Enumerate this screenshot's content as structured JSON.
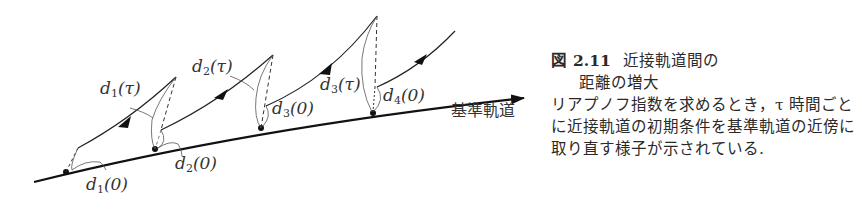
{
  "figure": {
    "number_prefix": "図",
    "number": "2.11",
    "title_line1": "近接軌道間の",
    "title_line2": "距離の増大",
    "description": "リアプノフ指数を求めるとき，τ 時間ごとに近接軌道の初期条件を基準軌道の近傍に取り直す様子が示されている."
  },
  "diagram": {
    "reference_trajectory_label": "基準軌道",
    "labels": {
      "d1_tau": {
        "var": "d",
        "sub": "1",
        "arg": "(τ)"
      },
      "d2_tau": {
        "var": "d",
        "sub": "2",
        "arg": "(τ)"
      },
      "d3_tau": {
        "var": "d",
        "sub": "3",
        "arg": "(τ)"
      },
      "d1_0": {
        "var": "d",
        "sub": "1",
        "arg": "(0)"
      },
      "d2_0": {
        "var": "d",
        "sub": "2",
        "arg": "(0)"
      },
      "d3_0": {
        "var": "d",
        "sub": "3",
        "arg": "(0)"
      },
      "d4_0": {
        "var": "d",
        "sub": "4",
        "arg": "(0)"
      }
    }
  }
}
